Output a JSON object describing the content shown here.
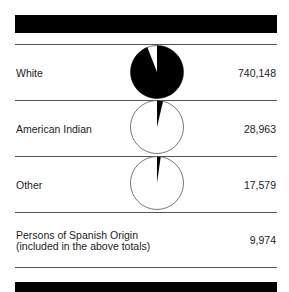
{
  "chart_data": {
    "type": "pie",
    "title": "",
    "categories": [
      "White",
      "American Indian",
      "Other"
    ],
    "values": [
      740148,
      28963,
      17579
    ],
    "total": 786690,
    "note_row": {
      "label_line1": "Persons of Spanish Origin",
      "label_line2": "(included in the above totals)",
      "value": 9974
    },
    "colors": {
      "slice": "#000000",
      "remainder": "#ffffff",
      "outline": "#555555"
    }
  },
  "rows": [
    {
      "label": "White",
      "value_text": "740,148"
    },
    {
      "label": "American Indian",
      "value_text": "28,963"
    },
    {
      "label": "Other",
      "value_text": "17,579"
    }
  ],
  "spanish": {
    "line1": "Persons of Spanish Origin",
    "line2": "(included in the above totals)",
    "value_text": "9,974"
  }
}
